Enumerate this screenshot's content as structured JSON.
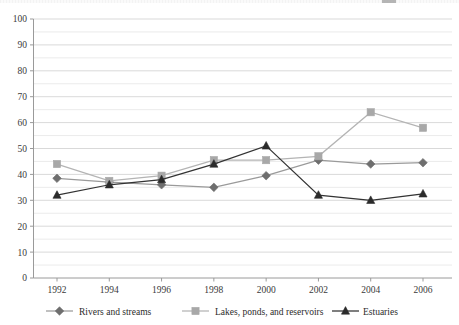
{
  "chart_data": {
    "type": "line",
    "title": "",
    "subtitle": "",
    "xlabel": "",
    "ylabel": "",
    "categories": [
      "1992",
      "1994",
      "1996",
      "1998",
      "2000",
      "2002",
      "2004",
      "2006"
    ],
    "x": [
      1992,
      1994,
      1996,
      1998,
      2000,
      2002,
      2004,
      2006
    ],
    "xlim": [
      1991,
      2007
    ],
    "ylim": [
      0,
      100
    ],
    "yticks": [
      "0",
      "10",
      "20",
      "30",
      "40",
      "50",
      "60",
      "70",
      "80",
      "90",
      "100"
    ],
    "ytick_values": [
      0,
      10,
      20,
      30,
      40,
      50,
      60,
      70,
      80,
      90,
      100
    ],
    "grid": true,
    "grid_minor": true,
    "legend_position": "bottom",
    "series": [
      {
        "name": "Rivers and streams",
        "marker": "diamond",
        "color": "#6e6e6e",
        "line_color": "#9a9a9a",
        "values": [
          38.5,
          37,
          36,
          35,
          39.5,
          45.5,
          44,
          44.5
        ]
      },
      {
        "name": "Lakes, ponds, and reservoirs",
        "marker": "square",
        "color": "#a8a8a8",
        "line_color": "#b4b4b4",
        "values": [
          44,
          37.5,
          39.5,
          45.5,
          45.5,
          47,
          64,
          58
        ]
      },
      {
        "name": "Estuaries",
        "marker": "triangle",
        "color": "#2b2b2b",
        "line_color": "#333333",
        "values": [
          32,
          36,
          38,
          44,
          51,
          32,
          30,
          32.5
        ]
      }
    ]
  },
  "legend": {
    "items": [
      {
        "label": "Rivers and streams"
      },
      {
        "label": "Lakes, ponds, and reservoirs"
      },
      {
        "label": "Estuaries"
      }
    ]
  },
  "colors": {
    "background": "#ffffff",
    "gridline": "#e2e2e2",
    "axis": "#9a9a9a",
    "text": "#3a3a3a",
    "series_rivers": "#6e6e6e",
    "series_lakes": "#a8a8a8",
    "series_estuaries": "#2b2b2b"
  }
}
